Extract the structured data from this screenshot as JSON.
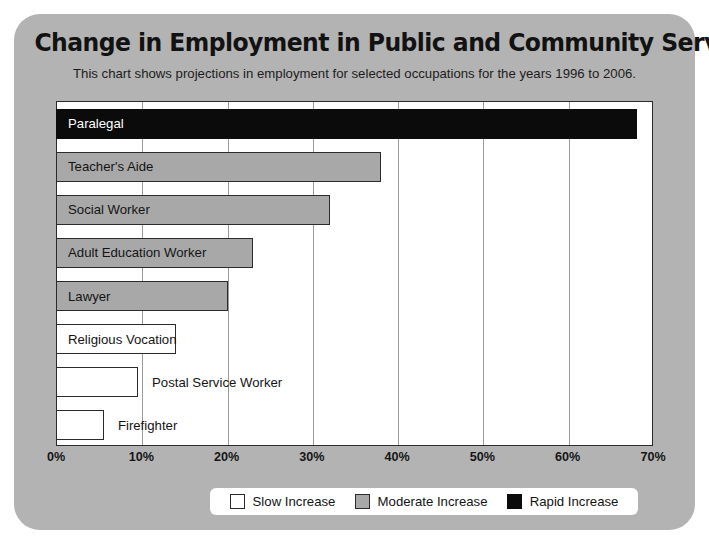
{
  "chart_data": {
    "type": "bar",
    "orientation": "horizontal",
    "title": "Change in Employment in Public and Community Services",
    "subtitle": "This chart shows projections in employment for selected occupations for the years 1996 to 2006.",
    "xlabel": "",
    "ylabel": "",
    "xlim": [
      0,
      70
    ],
    "xticks": [
      "0%",
      "10%",
      "20%",
      "30%",
      "40%",
      "50%",
      "60%",
      "70%"
    ],
    "xtick_values": [
      0,
      10,
      20,
      30,
      40,
      50,
      60,
      70
    ],
    "grid": true,
    "categories": [
      "Paralegal",
      "Teacher's Aide",
      "Social Worker",
      "Adult Education Worker",
      "Lawyer",
      "Religious Vocation",
      "Postal Service Worker",
      "Firefighter"
    ],
    "values": [
      68,
      38,
      32,
      23,
      20,
      14,
      9.5,
      5.5
    ],
    "bars": [
      {
        "label": "Paralegal",
        "value": 68,
        "category": "rapid",
        "label_inside": true
      },
      {
        "label": "Teacher's Aide",
        "value": 38,
        "category": "moderate",
        "label_inside": true
      },
      {
        "label": "Social Worker",
        "value": 32,
        "category": "moderate",
        "label_inside": true
      },
      {
        "label": "Adult Education Worker",
        "value": 23,
        "category": "moderate",
        "label_inside": true
      },
      {
        "label": "Lawyer",
        "value": 20,
        "category": "moderate",
        "label_inside": true
      },
      {
        "label": "Religious Vocation",
        "value": 14,
        "category": "slow",
        "label_inside": true
      },
      {
        "label": "Postal Service Worker",
        "value": 9.5,
        "category": "slow",
        "label_inside": false
      },
      {
        "label": "Firefighter",
        "value": 5.5,
        "category": "slow",
        "label_inside": false
      }
    ],
    "legend": {
      "position": "bottom",
      "entries": [
        {
          "label": "Slow Increase",
          "key": "slow",
          "color": "#ffffff"
        },
        {
          "label": "Moderate Increase",
          "key": "moderate",
          "color": "#a8a8a8"
        },
        {
          "label": "Rapid Increase",
          "key": "rapid",
          "color": "#0b0b0b"
        }
      ]
    },
    "colors": {
      "panel_background": "#b3b3b3",
      "plot_background": "#ffffff",
      "axis": "#2b2b2b",
      "gridline": "#9a9a9a",
      "slow": "#ffffff",
      "moderate": "#a8a8a8",
      "rapid": "#0b0b0b"
    }
  }
}
